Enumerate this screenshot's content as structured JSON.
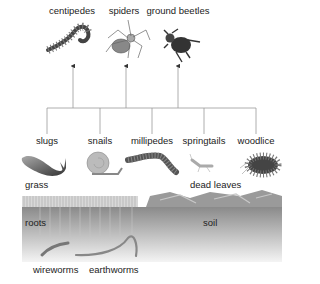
{
  "diagram": {
    "type": "food-web",
    "predators": [
      {
        "label": "centipedes",
        "x": 72
      },
      {
        "label": "spiders",
        "x": 126
      },
      {
        "label": "ground beetles",
        "x": 178
      }
    ],
    "decomposers_herbivores": [
      {
        "label": "slugs",
        "x": 47
      },
      {
        "label": "snails",
        "x": 100
      },
      {
        "label": "millipedes",
        "x": 152
      },
      {
        "label": "springtails",
        "x": 204
      },
      {
        "label": "woodlice",
        "x": 256
      }
    ],
    "habitat_labels": {
      "grass": "grass",
      "dead_leaves": "dead leaves",
      "roots": "roots",
      "soil": "soil"
    },
    "soil_dwellers": [
      {
        "label": "wireworms"
      },
      {
        "label": "earthworms"
      }
    ],
    "colors": {
      "line": "#888888",
      "soil_top": "#8a8a8a",
      "soil_bottom": "#f2f2f2",
      "animal": "#555555"
    }
  }
}
